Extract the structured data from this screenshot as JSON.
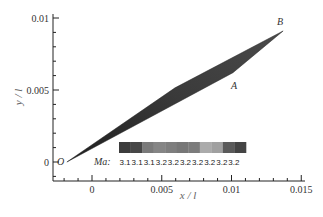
{
  "chart_data": {
    "type": "heatmap",
    "title": "",
    "xlabel": "x / l",
    "ylabel": "y / l",
    "xlim": [
      -0.0028,
      0.0152
    ],
    "ylim": [
      -0.0013,
      0.0108
    ],
    "xticks": [
      0,
      0.005,
      0.01,
      0.015
    ],
    "xtick_labels": [
      "0",
      "0.005",
      "0.01",
      "0.015"
    ],
    "yticks": [
      0,
      0.005,
      0.01
    ],
    "ytick_labels": [
      "0",
      "0.005",
      "0.01"
    ],
    "grid": false,
    "region": {
      "description": "Thin wedge-shaped Mach-number contour region between points O, A and B",
      "points": [
        {
          "label": "O",
          "x": -0.0018,
          "y": 0.0
        },
        {
          "label": "A",
          "x": 0.0101,
          "y": 0.0062
        },
        {
          "label": "B",
          "x": 0.0137,
          "y": 0.0091
        }
      ],
      "upper_edge": [
        [
          -0.0018,
          0.0
        ],
        [
          0.0137,
          0.0091
        ]
      ],
      "lower_edge": [
        [
          -0.0018,
          0.0
        ],
        [
          0.0101,
          0.0062
        ],
        [
          0.0137,
          0.0091
        ]
      ]
    },
    "colorbar": {
      "variable": "Ma",
      "label": "Ma:",
      "position": "inside plot, lower-middle, horizontal",
      "levels": [
        "3.1",
        "3.1",
        "3.1",
        "3.2",
        "3.2",
        "3.2",
        "3.2",
        "3.2",
        "3.2",
        "3.2"
      ],
      "colors": [
        "#3c3c3c",
        "#474747",
        "#7a7a7a",
        "#858585",
        "#7e7e7e",
        "#777777",
        "#7c7c7c",
        "#ababab",
        "#a0a0a0",
        "#5a5a5a",
        "#444444"
      ]
    }
  }
}
